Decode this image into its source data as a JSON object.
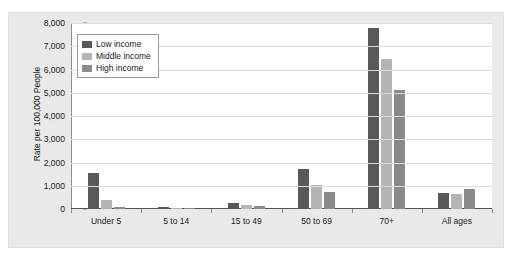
{
  "figure": {
    "title_remnant": "",
    "panel_background": "#e9e9e9",
    "plot_background": "#ffffff"
  },
  "chart_data": {
    "type": "bar",
    "title": "",
    "subtitle": "",
    "xlabel": "",
    "ylabel": "Rate per 100,000 People",
    "categories": [
      "Under 5",
      "5 to 14",
      "15 to 49",
      "50 to 69",
      "70+",
      "All ages"
    ],
    "series": [
      {
        "name": "Low income",
        "color": "#595959",
        "values": [
          1550,
          85,
          250,
          1720,
          7800,
          680
        ]
      },
      {
        "name": "Middle income",
        "color": "#b4b4b4",
        "values": [
          380,
          35,
          160,
          1040,
          6450,
          630
        ]
      },
      {
        "name": "High income",
        "color": "#8a8a8a",
        "values": [
          90,
          25,
          110,
          720,
          5100,
          880
        ]
      }
    ],
    "ylim": [
      0,
      8000
    ],
    "yticks": [
      0,
      1000,
      2000,
      3000,
      4000,
      5000,
      6000,
      7000,
      8000
    ],
    "ytick_labels": [
      "0",
      "1,000",
      "2,000",
      "3,000",
      "4,000",
      "5,000",
      "6,000",
      "7,000",
      "8,000"
    ],
    "grid": true,
    "grid_axis": "y",
    "legend_position": "upper-left",
    "legend_entries": [
      "Low income",
      "Middle income",
      "High income"
    ]
  }
}
